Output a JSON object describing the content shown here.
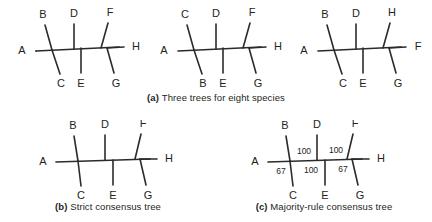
{
  "figure": {
    "background_color": "#ffffff",
    "line_color": "#2b2b2b",
    "text_color": "#231f20"
  },
  "captions": {
    "a": {
      "label": "(a)",
      "text": "Three trees for eight species"
    },
    "b": {
      "label": "(b)",
      "text": "Strict consensus tree"
    },
    "c": {
      "label": "(c)",
      "text": "Majority-rule consensus tree"
    }
  },
  "trees": {
    "tree1": {
      "name": "tree-1",
      "left_taxon": "A",
      "right_taxon": "H",
      "top_taxa": [
        "B",
        "D",
        "F"
      ],
      "bottom_taxa": [
        "C",
        "E",
        "G"
      ]
    },
    "tree2": {
      "name": "tree-2",
      "left_taxon": "A",
      "right_taxon": "H",
      "top_taxa": [
        "C",
        "D",
        "F"
      ],
      "bottom_taxa": [
        "B",
        "E",
        "G"
      ]
    },
    "tree3": {
      "name": "tree-3",
      "left_taxon": "A",
      "right_taxon": "F",
      "top_taxa": [
        "B",
        "D",
        "H"
      ],
      "bottom_taxa": [
        "C",
        "E",
        "G"
      ]
    },
    "strict": {
      "name": "strict-consensus-tree",
      "left_taxon": "A",
      "right_taxon": "H",
      "top_taxa": [
        "B",
        "D",
        "F"
      ],
      "bottom_taxa": [
        "C",
        "E",
        "G"
      ]
    },
    "majority": {
      "name": "majority-rule-consensus-tree",
      "left_taxon": "A",
      "right_taxon": "H",
      "top_taxa": [
        "B",
        "D",
        "F"
      ],
      "bottom_taxa": [
        "C",
        "E",
        "G"
      ],
      "support_values": {
        "above_left": "100",
        "above_right": "100",
        "below_left": "67",
        "below_center": "100",
        "below_right": "67"
      }
    }
  }
}
